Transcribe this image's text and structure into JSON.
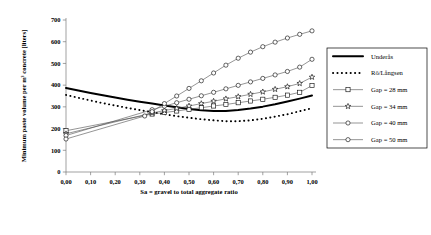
{
  "chart_data": {
    "type": "line",
    "title": "",
    "xlabel": "Sa = gravel to total aggregate ratio",
    "ylabel": "Minimum paste volume per m³ concrete [liters]",
    "xlim": [
      0.0,
      1.0
    ],
    "ylim": [
      0,
      700
    ],
    "xticks": [
      "0,00",
      "0,10",
      "0,20",
      "0,30",
      "0,40",
      "0,50",
      "0,60",
      "0,70",
      "0,80",
      "0,90",
      "1,00"
    ],
    "xtick_values": [
      0.0,
      0.1,
      0.2,
      0.3,
      0.4,
      0.5,
      0.6,
      0.7,
      0.8,
      0.9,
      1.0
    ],
    "yticks": [
      "0",
      "100",
      "200",
      "300",
      "400",
      "500",
      "600",
      "700"
    ],
    "ytick_values": [
      0,
      100,
      200,
      300,
      400,
      500,
      600,
      700
    ],
    "grid": false,
    "legend_position": "right",
    "series": [
      {
        "name": "Underås",
        "style": "solid-thick",
        "marker": "none",
        "x": [
          0.0,
          0.05,
          0.1,
          0.15,
          0.2,
          0.25,
          0.3,
          0.35,
          0.4,
          0.45,
          0.5,
          0.55,
          0.6,
          0.65,
          0.7,
          0.75,
          0.8,
          0.85,
          0.9,
          0.95,
          1.0
        ],
        "y": [
          387,
          375,
          364,
          353,
          343,
          333,
          324,
          315,
          306,
          298,
          290,
          284,
          281,
          281,
          285,
          292,
          301,
          312,
          325,
          338,
          352
        ]
      },
      {
        "name": "Rö/Långsen",
        "style": "dotted",
        "marker": "none",
        "x": [
          0.0,
          0.05,
          0.1,
          0.15,
          0.2,
          0.25,
          0.3,
          0.35,
          0.4,
          0.45,
          0.5,
          0.55,
          0.6,
          0.65,
          0.7,
          0.75,
          0.8,
          0.85,
          0.9,
          0.95,
          1.0
        ],
        "y": [
          355,
          342,
          329,
          317,
          306,
          295,
          285,
          275,
          266,
          257,
          250,
          243,
          238,
          234,
          234,
          238,
          245,
          255,
          266,
          280,
          294
        ]
      },
      {
        "name": "Gap = 28 mm",
        "style": "thin",
        "marker": "square",
        "x": [
          0.0,
          0.35,
          0.4,
          0.45,
          0.5,
          0.55,
          0.6,
          0.65,
          0.7,
          0.75,
          0.8,
          0.85,
          0.9,
          0.95,
          1.0
        ],
        "y": [
          190,
          267,
          274,
          281,
          289,
          296,
          304,
          311,
          319,
          327,
          335,
          344,
          354,
          367,
          398
        ]
      },
      {
        "name": "Gap = 34 mm",
        "style": "thin",
        "marker": "star",
        "x": [
          0.0,
          0.35,
          0.4,
          0.45,
          0.5,
          0.55,
          0.6,
          0.65,
          0.7,
          0.75,
          0.8,
          0.85,
          0.9,
          0.95,
          1.0
        ],
        "y": [
          176,
          272,
          283,
          293,
          304,
          315,
          326,
          337,
          347,
          358,
          369,
          381,
          393,
          408,
          437
        ]
      },
      {
        "name": "Gap = 40 mm",
        "style": "thin",
        "marker": "circle",
        "x": [
          0.0,
          0.35,
          0.4,
          0.45,
          0.5,
          0.55,
          0.6,
          0.65,
          0.7,
          0.75,
          0.8,
          0.85,
          0.9,
          0.95,
          1.0
        ],
        "y": [
          168,
          287,
          303,
          319,
          335,
          351,
          367,
          383,
          399,
          415,
          431,
          447,
          463,
          483,
          519
        ]
      },
      {
        "name": "Gap = 50 mm",
        "style": "thin",
        "marker": "circle",
        "x": [
          0.0,
          0.32,
          0.35,
          0.4,
          0.45,
          0.5,
          0.55,
          0.6,
          0.65,
          0.7,
          0.75,
          0.8,
          0.85,
          0.9,
          0.95,
          1.0
        ],
        "y": [
          152,
          258,
          278,
          315,
          350,
          385,
          420,
          456,
          492,
          524,
          552,
          577,
          598,
          617,
          634,
          650
        ]
      }
    ]
  },
  "legend": {
    "items": [
      {
        "label": "Underås"
      },
      {
        "label": "Rö/Långsen"
      },
      {
        "label": "Gap = 28 mm"
      },
      {
        "label": "Gap = 34 mm"
      },
      {
        "label": "Gap = 40 mm"
      },
      {
        "label": "Gap = 50 mm"
      }
    ]
  },
  "colors": {
    "axis": "#7a7a7a",
    "series_line": "#4d4d4d",
    "primary": "#000000",
    "background": "#ffffff"
  }
}
